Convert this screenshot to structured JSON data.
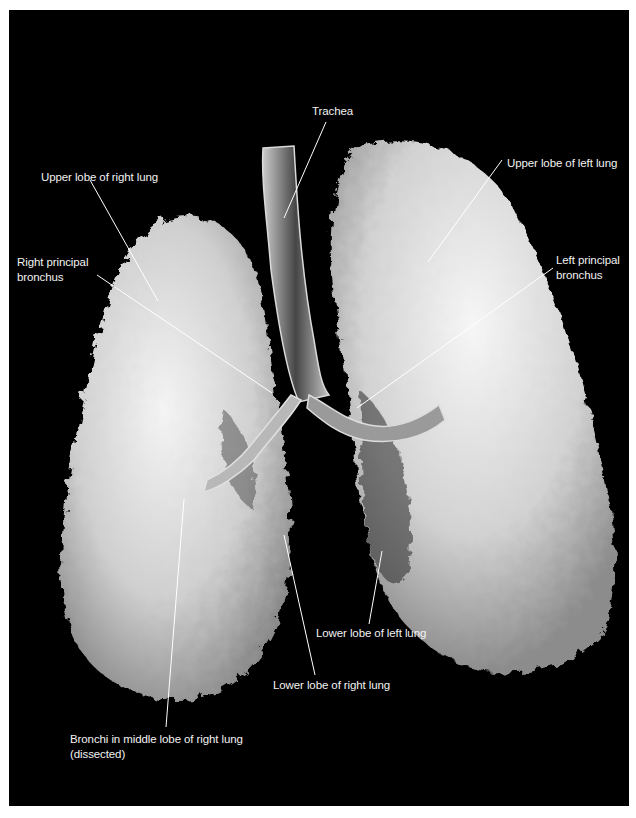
{
  "figure": {
    "background_color": "#000000",
    "label_color": "#f2f2f2",
    "specimen": "Cast of lungs and bronchial tree (anterior view)"
  },
  "labels": [
    {
      "id": "trachea",
      "text": "Trachea"
    },
    {
      "id": "upper_right",
      "text": "Upper lobe of right lung"
    },
    {
      "id": "upper_left",
      "text": "Upper lobe of left lung"
    },
    {
      "id": "right_bronchus",
      "text": "Right principal\nbronchus"
    },
    {
      "id": "left_bronchus",
      "text": "Left principal\nbronchus"
    },
    {
      "id": "lower_left",
      "text": "Lower lobe of left lung"
    },
    {
      "id": "lower_right",
      "text": "Lower lobe of right lung"
    },
    {
      "id": "middle_bronchi",
      "text": "Bronchi in middle lobe of right lung\n(dissected)"
    }
  ]
}
